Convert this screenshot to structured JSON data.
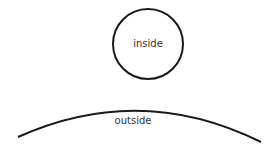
{
  "diagram": {
    "circle": {
      "label": "inside",
      "cx": 148,
      "cy": 44,
      "r": 36
    },
    "arc": {
      "label": "outside"
    },
    "stroke_color": "#1a1a1a",
    "text_color": "#333333"
  }
}
